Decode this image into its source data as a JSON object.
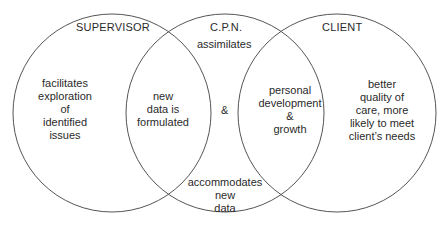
{
  "diagram": {
    "type": "venn",
    "circles": [
      {
        "id": "supervisor",
        "label": "SUPERVISOR",
        "cx": 112,
        "cy": 113,
        "r": 99
      },
      {
        "id": "cpn",
        "label": "C.P.N.",
        "cx": 225,
        "cy": 113,
        "r": 99
      },
      {
        "id": "client",
        "label": "CLIENT",
        "cx": 337,
        "cy": 113,
        "r": 99
      }
    ],
    "stroke_color": "#555555",
    "text_color": "#2a2a2a"
  },
  "labels": {
    "supervisor_title": "SUPERVISOR",
    "cpn_title": "C.P.N.",
    "client_title": "CLIENT",
    "assimilates": "assimilates",
    "supervisor_only": [
      "facilitates",
      "exploration",
      "of",
      "identified",
      "issues"
    ],
    "supervisor_cpn_overlap": [
      "new",
      "data is",
      "formulated"
    ],
    "ampersand": "&",
    "cpn_client_overlap": [
      "personal",
      "development",
      "&",
      "growth"
    ],
    "client_only": [
      "better",
      "quality of",
      "care, more",
      "likely to meet",
      "client’s needs"
    ],
    "accommodates": [
      "accommodates",
      "new",
      "data"
    ]
  }
}
